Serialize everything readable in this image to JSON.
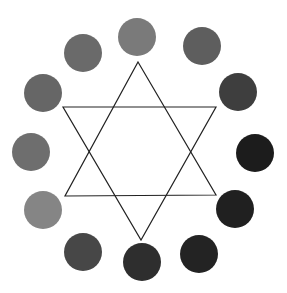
{
  "figure": {
    "width": 287,
    "height": 293,
    "background": "#ffffff"
  },
  "circles": [
    {
      "cx": 137,
      "cy": 37,
      "r": 19,
      "fill": "#7a7a7a"
    },
    {
      "cx": 202,
      "cy": 46,
      "r": 19,
      "fill": "#5e5e5e"
    },
    {
      "cx": 238,
      "cy": 92,
      "r": 19,
      "fill": "#3e3e3e"
    },
    {
      "cx": 255,
      "cy": 153,
      "r": 19,
      "fill": "#1c1c1c"
    },
    {
      "cx": 235,
      "cy": 209,
      "r": 19,
      "fill": "#202020"
    },
    {
      "cx": 199,
      "cy": 254,
      "r": 19,
      "fill": "#232323"
    },
    {
      "cx": 142,
      "cy": 262,
      "r": 19,
      "fill": "#2e2e2e"
    },
    {
      "cx": 83,
      "cy": 252,
      "r": 19,
      "fill": "#474747"
    },
    {
      "cx": 43,
      "cy": 210,
      "r": 19,
      "fill": "#858585"
    },
    {
      "cx": 31,
      "cy": 152,
      "r": 19,
      "fill": "#6e6e6e"
    },
    {
      "cx": 43,
      "cy": 93,
      "r": 19,
      "fill": "#666666"
    },
    {
      "cx": 83,
      "cy": 53,
      "r": 19,
      "fill": "#6a6a6a"
    }
  ],
  "star": {
    "stroke": "#222222",
    "stroke_width": 1.2,
    "triangle_up": "138,62 216,195 65,196",
    "triangle_down": "63,107 216,107 141,240"
  }
}
